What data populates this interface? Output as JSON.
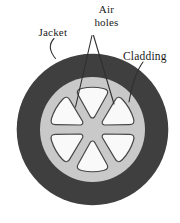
{
  "diagram": {
    "labels": {
      "jacket": "Jacket",
      "air_line1": "Air",
      "air_line2": "holes",
      "cladding": "Cladding"
    },
    "colors": {
      "background": "#ffffff",
      "jacket": "#3f3f3f",
      "cladding": "#c9c9c9",
      "air_hole": "#f9f9f9",
      "hole_outline": "#474747",
      "leader_line": "#2f2f2f",
      "label_text": "#1b1b1b"
    }
  }
}
